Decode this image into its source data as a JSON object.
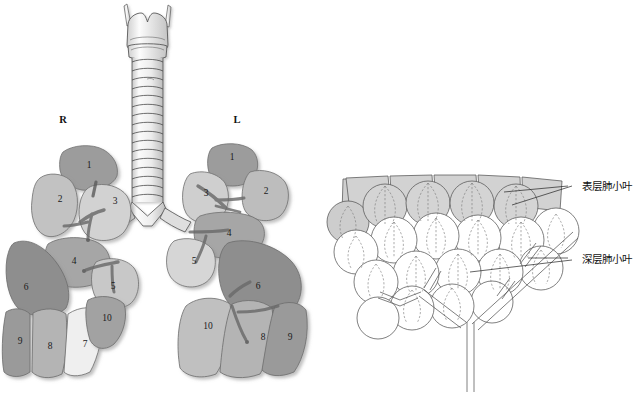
{
  "figure": {
    "background_color": "#ffffff"
  },
  "left_panel": {
    "name": "lung-segments-panel",
    "side_labels": [
      {
        "text": "R",
        "x": 63,
        "y": 121,
        "meaning": "right"
      },
      {
        "text": "L",
        "x": 237,
        "y": 121,
        "meaning": "left"
      }
    ],
    "airway": {
      "name": "trachea-larynx",
      "parts": [
        "thyroid-cartilage",
        "cricoid-cartilage",
        "tracheal-rings",
        "carina",
        "main-bronchi"
      ],
      "ring_count": 16
    },
    "right_lung": {
      "name": "right-lung",
      "segments": [
        {
          "number": "1",
          "x": 89,
          "y": 166,
          "tone": "#9c9c9c"
        },
        {
          "number": "2",
          "x": 60,
          "y": 200,
          "tone": "#c2c2c2"
        },
        {
          "number": "3",
          "x": 115,
          "y": 202,
          "tone": "#d2d2d2"
        },
        {
          "number": "4",
          "x": 74,
          "y": 262,
          "tone": "#a6a6a6"
        },
        {
          "number": "5",
          "x": 113,
          "y": 287,
          "tone": "#c8c8c8"
        },
        {
          "number": "6",
          "x": 26,
          "y": 288,
          "tone": "#8e8e8e"
        },
        {
          "number": "7",
          "x": 85,
          "y": 345,
          "tone": "#efefef"
        },
        {
          "number": "8",
          "x": 50,
          "y": 347,
          "tone": "#b4b4b4"
        },
        {
          "number": "9",
          "x": 20,
          "y": 342,
          "tone": "#9a9a9a"
        },
        {
          "number": "10",
          "x": 107,
          "y": 319,
          "tone": "#a2a2a2"
        }
      ]
    },
    "left_lung": {
      "name": "left-lung",
      "segments": [
        {
          "number": "1",
          "x": 232,
          "y": 158,
          "tone": "#9c9c9c"
        },
        {
          "number": "2",
          "x": 266,
          "y": 192,
          "tone": "#bdbdbd"
        },
        {
          "number": "3",
          "x": 206,
          "y": 194,
          "tone": "#cfcfcf"
        },
        {
          "number": "4",
          "x": 229,
          "y": 234,
          "tone": "#a6a6a6"
        },
        {
          "number": "5",
          "x": 194,
          "y": 262,
          "tone": "#d6d6d6"
        },
        {
          "number": "6",
          "x": 258,
          "y": 287,
          "tone": "#8e8e8e"
        },
        {
          "number": "8",
          "x": 263,
          "y": 338,
          "tone": "#b4b4b4"
        },
        {
          "number": "9",
          "x": 290,
          "y": 338,
          "tone": "#9a9a9a"
        },
        {
          "number": "10",
          "x": 208,
          "y": 327,
          "tone": "#c0c0c0"
        }
      ]
    }
  },
  "right_panel": {
    "name": "pulmonary-lobule-panel",
    "labels": [
      {
        "id": "superficial",
        "text": "表层肺小叶",
        "x": 584,
        "y": 187
      },
      {
        "id": "deep",
        "text": "深层肺小叶",
        "x": 584,
        "y": 260
      }
    ],
    "shaded_lobule_color": "#d0d0d0",
    "deep_lobule_color": "#ffffff",
    "surface_lobule_count": 5,
    "airway_name": "bronchiole-tree"
  }
}
